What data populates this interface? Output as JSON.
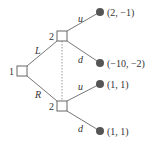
{
  "diagram": {
    "type": "extensive-form game tree",
    "colors": {
      "line": "#777777",
      "node_fill": "#ffffff",
      "node_stroke": "#666666",
      "terminal": "#555555",
      "text": "#333333"
    },
    "root": {
      "player": "1",
      "x": 22,
      "y": 71
    },
    "actions_player1": {
      "left": "L",
      "right": "R"
    },
    "upper_node": {
      "player": "2",
      "x": 62,
      "y": 36
    },
    "lower_node": {
      "player": "2",
      "x": 62,
      "y": 106
    },
    "information_set": "dotted",
    "actions_player2": {
      "up": "u",
      "down": "d"
    },
    "terminals": [
      {
        "payoff": "(2, −1)",
        "x": 100,
        "y": 12
      },
      {
        "payoff": "(−10, −2)",
        "x": 100,
        "y": 63
      },
      {
        "payoff": "(1, 1)",
        "x": 100,
        "y": 84
      },
      {
        "payoff": "(1, 1)",
        "x": 100,
        "y": 131
      }
    ]
  }
}
